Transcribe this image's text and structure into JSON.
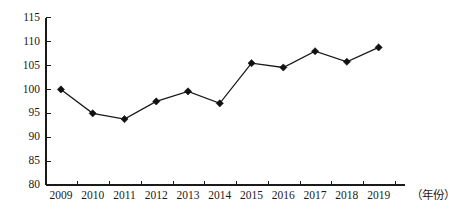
{
  "chart_data": {
    "type": "line",
    "title": "",
    "subtitle": "",
    "xlabel": "（年份）",
    "ylabel": "",
    "categories": [
      "2009",
      "2010",
      "2011",
      "2012",
      "2013",
      "2014",
      "2015",
      "2016",
      "2017",
      "2018",
      "2019"
    ],
    "values": [
      100.0,
      95.0,
      93.8,
      97.5,
      99.6,
      97.1,
      105.5,
      104.6,
      108.0,
      105.8,
      108.8
    ],
    "series": [
      {
        "name": "",
        "values": [
          100.0,
          95.0,
          93.8,
          97.5,
          99.6,
          97.1,
          105.5,
          104.6,
          108.0,
          105.8,
          108.8
        ]
      }
    ],
    "ylim": [
      80,
      115
    ],
    "ytick_values": [
      80,
      85,
      90,
      95,
      100,
      105,
      110,
      115
    ],
    "ytick_labels": [
      "80",
      "85",
      "90",
      "95",
      "100",
      "105",
      "110",
      "115"
    ],
    "xtick_labels": [
      "2009",
      "2010",
      "2011",
      "2012",
      "2013",
      "2014",
      "2015",
      "2016",
      "2017",
      "2018",
      "2019"
    ],
    "grid": false,
    "legend": null,
    "legend_position": "none",
    "marker": "diamond",
    "line_color": "#1a1a1a",
    "marker_color": "#111111",
    "background_color": "#ffffff",
    "annotations": []
  },
  "axis": {
    "x_caption": "（年份）",
    "y_caption": ""
  }
}
